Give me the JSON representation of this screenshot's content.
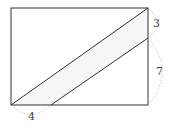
{
  "diagram": {
    "type": "geometry",
    "shape": "rectangle with parallel diagonal strip",
    "labels": {
      "top_right_segment": "3",
      "right_lower_segment": "7",
      "bottom_left_segment": "4"
    },
    "colors": {
      "stroke": "#333333",
      "strip_fill": "#f6f6f6",
      "arc": "#bbbbbb"
    }
  }
}
